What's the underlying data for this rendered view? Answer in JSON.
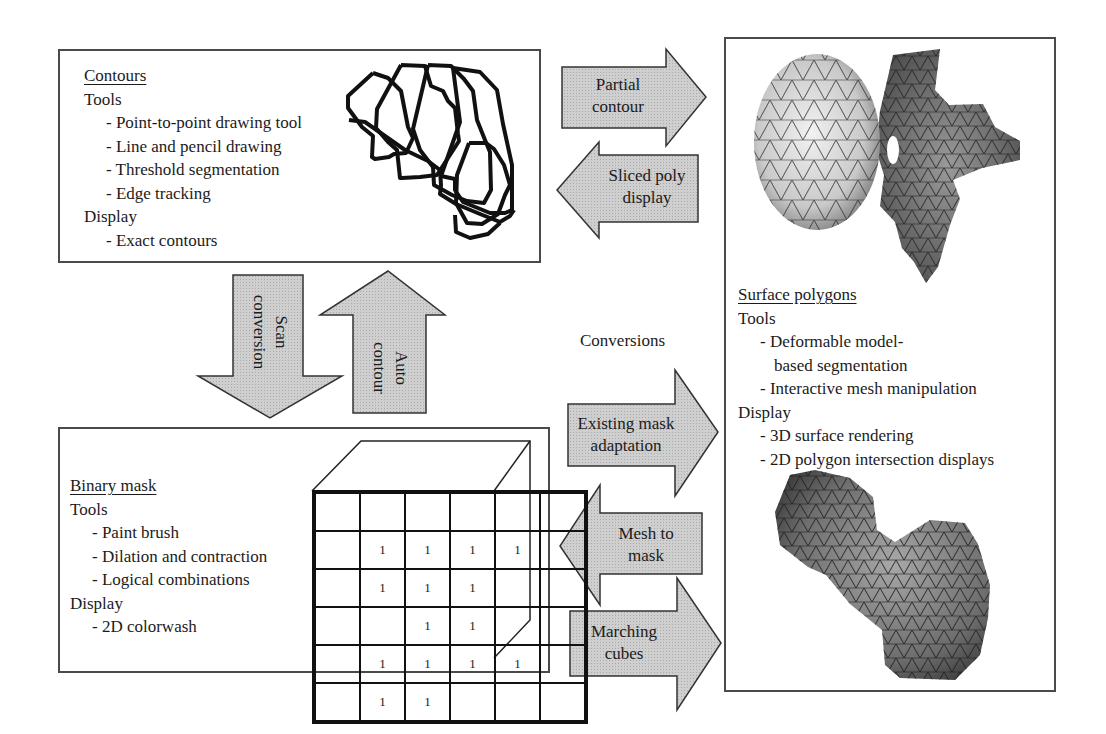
{
  "colors": {
    "arrow_fill": "#c8c8c8",
    "arrow_stroke": "#333333",
    "panel_border": "#4a4a4a",
    "mesh_dark": "#4a4a4a",
    "mesh_light": "#d8d8d8"
  },
  "contours": {
    "title": "Contours",
    "tools_heading": "Tools",
    "tools": [
      "- Point-to-point drawing tool",
      "- Line and pencil drawing",
      "- Threshold segmentation",
      "- Edge tracking"
    ],
    "display_heading": "Display",
    "display": [
      "- Exact contours"
    ]
  },
  "binary_mask": {
    "title": "Binary mask",
    "tools_heading": "Tools",
    "tools": [
      "- Paint brush",
      "- Dilation and contraction",
      "- Logical combinations"
    ],
    "display_heading": "Display",
    "display": [
      "- 2D colorwash"
    ],
    "grid": [
      [
        "",
        "",
        "",
        "",
        "",
        ""
      ],
      [
        "",
        "1",
        "1",
        "1",
        "1",
        ""
      ],
      [
        "",
        "1",
        "1",
        "1",
        "",
        ""
      ],
      [
        "",
        "",
        "1",
        "1",
        "",
        ""
      ],
      [
        "",
        "1",
        "1",
        "1",
        "1",
        ""
      ],
      [
        "",
        "1",
        "1",
        "",
        "",
        ""
      ]
    ]
  },
  "surface_polygons": {
    "title": "Surface polygons",
    "tools_heading": "Tools",
    "tools": [
      "- Deformable model-",
      "based segmentation",
      "- Interactive mesh manipulation"
    ],
    "display_heading": "Display",
    "display": [
      "- 3D surface rendering",
      "- 2D polygon intersection displays"
    ],
    "images": [
      "vertebra-mesh",
      "femur-mesh"
    ]
  },
  "conversions": {
    "label": "Conversions",
    "arrows": {
      "partial_contour": [
        "Partial",
        "contour"
      ],
      "sliced_poly_display": [
        "Sliced poly",
        "display"
      ],
      "scan_conversion": [
        "Scan",
        "conversion"
      ],
      "auto_contour": [
        "Auto",
        "contour"
      ],
      "existing_mask_adaptation": [
        "Existing mask",
        "adaptation"
      ],
      "mesh_to_mask": [
        "Mesh to",
        "mask"
      ],
      "marching_cubes": [
        "Marching",
        "cubes"
      ]
    }
  }
}
